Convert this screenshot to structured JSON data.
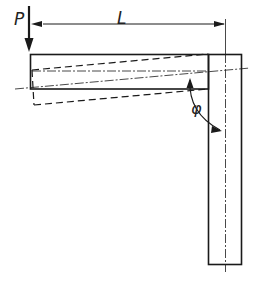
{
  "diagram": {
    "type": "L-frame cantilever with end load",
    "labels": {
      "load": "P",
      "length": "L",
      "angle": "φ"
    },
    "colors": {
      "stroke": "#1a1a1a",
      "background": "#ffffff"
    },
    "elements": [
      {
        "name": "load-arrow",
        "label": "P",
        "direction": "down"
      },
      {
        "name": "length-dimension",
        "label": "L"
      },
      {
        "name": "horizontal-beam",
        "style": "solid"
      },
      {
        "name": "vertical-post",
        "style": "solid"
      },
      {
        "name": "deflected-shape",
        "style": "dashed"
      },
      {
        "name": "centerlines",
        "style": "dash-dot"
      },
      {
        "name": "rotation-angle-arc",
        "label": "φ"
      }
    ]
  }
}
